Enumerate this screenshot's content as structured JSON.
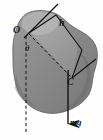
{
  "figure": {
    "name": "rigid-body-pendulum-diagram",
    "background_color": "#fefefe",
    "body": {
      "fill_color": "#8a8a8a",
      "shade_light_color": "#a8a8a8",
      "shade_dark_color": "#6e6e6e",
      "outline_color": "#5a5a5a"
    },
    "line_color": "#141414",
    "labels": {
      "pivot": "O",
      "angle": "θ",
      "distance": "h",
      "center_of_mass": "C",
      "weight_force": "mg"
    },
    "annotations": {
      "dashed_vertical": "vertical reference line through O",
      "dashed_diagonal": "line from O to C",
      "solid_axis": "axis line through O marked h",
      "force_arrow": "downward weight vector mg at C"
    }
  }
}
